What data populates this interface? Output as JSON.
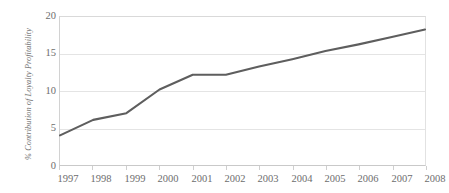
{
  "chart_data": {
    "type": "line",
    "title": "",
    "subtitle": "",
    "xlabel": "",
    "ylabel": "% Contribution of Loyalty Profitability",
    "x": [
      "1997",
      "1998",
      "1999",
      "2000",
      "2001",
      "2002",
      "2003",
      "2004",
      "2005",
      "2006",
      "2007",
      "2008"
    ],
    "categories": [
      "1997",
      "1998",
      "1999",
      "2000",
      "2001",
      "2002",
      "2003",
      "2004",
      "2005",
      "2006",
      "2007",
      "2008"
    ],
    "values": [
      4.0,
      6.1,
      7.0,
      10.2,
      12.2,
      12.2,
      13.3,
      14.3,
      15.4,
      16.3,
      17.3,
      18.3
    ],
    "series": [
      {
        "name": "% Contribution of Loyalty Profitability",
        "values": [
          4.0,
          6.1,
          7.0,
          10.2,
          12.2,
          12.2,
          13.3,
          14.3,
          15.4,
          16.3,
          17.3,
          18.3
        ],
        "color": "#5e5e5e"
      }
    ],
    "ylim": [
      0,
      20
    ],
    "yticks": [
      0,
      5,
      10,
      15,
      20
    ],
    "ytick_labels": [
      "0",
      "5",
      "10",
      "15",
      "20"
    ],
    "xtick_labels": [
      "1997",
      "1998",
      "1999",
      "2000",
      "2001",
      "2002",
      "2003",
      "2004",
      "2005",
      "2006",
      "2007",
      "2008"
    ],
    "grid": "horizontal",
    "legend": "none",
    "annotations": []
  },
  "axis": {
    "y_title": "% Contribution of Loyalty Profitability",
    "y_ticks": [
      "20",
      "15",
      "10",
      "5",
      "0"
    ]
  },
  "colors": {
    "line": "#5e5e5e",
    "gridline": "#e4e4e4",
    "frame": "#d2d2d2",
    "tick_text": "#6d6d6d",
    "axis_title": "#6f6f6f",
    "background": "#ffffff"
  }
}
